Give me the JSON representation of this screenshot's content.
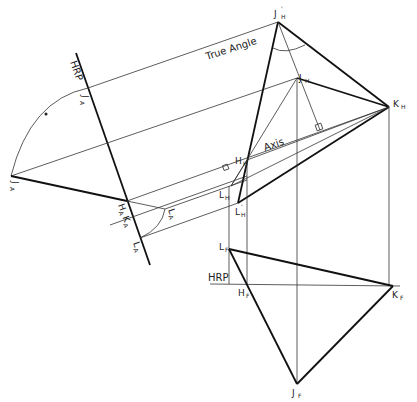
{
  "diagram": {
    "type": "descriptive-geometry-construction",
    "annotations": {
      "true_angle": "True Angle",
      "axis": "Axis",
      "hrp_aux": "HRP",
      "hrp_front": "HRP"
    },
    "points": {
      "J_H_prime": {
        "label": "J",
        "sub": "H",
        "sup": "'"
      },
      "J_H": {
        "label": "J",
        "sub": "H"
      },
      "K_H": {
        "label": "K",
        "sub": "H"
      },
      "H_H": {
        "label": "H",
        "sub": "H"
      },
      "L_H": {
        "label": "L",
        "sub": "H"
      },
      "L_H_prime": {
        "label": "L",
        "sub": "H",
        "sup": "'"
      },
      "J_A_prime": {
        "label": "J",
        "sub": "A",
        "sup": "'"
      },
      "J_A": {
        "label": "J",
        "sub": "A"
      },
      "H_A_K_A": {
        "label": "H",
        "sub": "A",
        "label2": "K",
        "sub2": "A"
      },
      "L_A": {
        "label": "L",
        "sub": "A"
      },
      "L_A_prime": {
        "label": "L",
        "sub": "A",
        "sup": "'"
      },
      "L_F": {
        "label": "L",
        "sub": "F"
      },
      "H_F": {
        "label": "H",
        "sub": "F"
      },
      "K_F": {
        "label": "K",
        "sub": "F"
      },
      "J_F": {
        "label": "J",
        "sub": "F"
      }
    },
    "colors": {
      "background": "#ffffff",
      "ink": "#111111"
    }
  }
}
